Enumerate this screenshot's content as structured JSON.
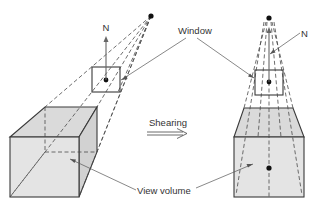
{
  "figure": {
    "labels": {
      "window": "Window",
      "normal_left": "N",
      "normal_right": "N",
      "operation": "Shearing",
      "view_volume": "View volume"
    },
    "colors": {
      "line": "#3a3a3a",
      "face_fill": "#e4e4e4",
      "background": "#ffffff"
    },
    "panels": [
      {
        "name": "before-shear",
        "description": "Oblique view volume with window and normal N, center of projection off-axis"
      },
      {
        "name": "after-shear",
        "description": "Sheared view volume aligned with window normal, symmetric frustum"
      }
    ]
  }
}
